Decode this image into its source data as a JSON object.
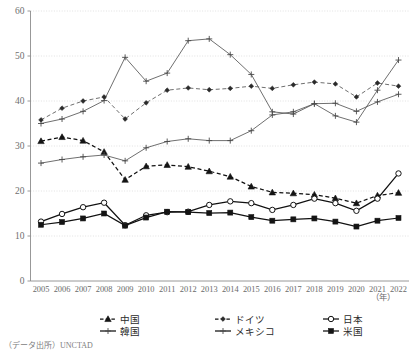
{
  "chart_data": {
    "type": "line",
    "title": "",
    "subtitle": "",
    "xlabel": "(年)",
    "ylabel": "",
    "ylim": [
      0,
      60
    ],
    "yticks": [
      0,
      10,
      20,
      30,
      40,
      50,
      60
    ],
    "grid": true,
    "legend_position": "bottom",
    "x": [
      2005,
      2006,
      2007,
      2008,
      2009,
      2010,
      2011,
      2012,
      2013,
      2014,
      2015,
      2016,
      2017,
      2018,
      2019,
      2020,
      2021,
      2022
    ],
    "categories": [
      "2005",
      "2006",
      "2007",
      "2008",
      "2009",
      "2010",
      "2011",
      "2012",
      "2013",
      "2014",
      "2015",
      "2016",
      "2017",
      "2018",
      "2019",
      "2020",
      "2021",
      "2022"
    ],
    "series": [
      {
        "name": "中国",
        "marker": "triangle-filled",
        "line": "dashed",
        "values": [
          31.1,
          32.0,
          31.2,
          28.7,
          22.5,
          25.5,
          25.8,
          25.4,
          24.4,
          23.2,
          21.0,
          19.7,
          19.5,
          19.2,
          18.4,
          17.3,
          19.0,
          19.6
        ]
      },
      {
        "name": "韓国",
        "marker": "cross",
        "line": "solid",
        "values": [
          35.0,
          36.0,
          37.7,
          40.1,
          49.7,
          44.4,
          46.2,
          53.4,
          53.8,
          50.3,
          45.9,
          37.6,
          37.1,
          39.4,
          36.7,
          35.3,
          42.4,
          49.1
        ]
      },
      {
        "name": "ドイツ",
        "marker": "diamond-filled",
        "line": "dashed",
        "values": [
          35.8,
          38.4,
          40.0,
          40.9,
          36.0,
          39.6,
          42.4,
          42.9,
          42.5,
          42.8,
          43.3,
          42.8,
          43.6,
          44.2,
          43.8,
          40.9,
          44.0,
          43.3
        ]
      },
      {
        "name": "メキシコ",
        "marker": "cross",
        "line": "solid",
        "values": [
          26.2,
          27.0,
          27.6,
          28.0,
          26.7,
          29.6,
          31.0,
          31.6,
          31.2,
          31.2,
          33.4,
          36.9,
          37.6,
          39.4,
          39.5,
          37.7,
          39.8,
          41.5
        ]
      },
      {
        "name": "日本",
        "marker": "circle-open",
        "line": "solid",
        "values": [
          13.2,
          14.9,
          16.4,
          17.4,
          12.4,
          14.6,
          15.3,
          15.4,
          16.9,
          17.7,
          17.3,
          15.8,
          16.9,
          18.3,
          17.3,
          15.6,
          18.3,
          23.9
        ]
      },
      {
        "name": "米国",
        "marker": "square-filled",
        "line": "solid",
        "values": [
          12.5,
          13.1,
          13.9,
          15.0,
          12.3,
          14.1,
          15.4,
          15.3,
          15.1,
          15.2,
          14.2,
          13.4,
          13.7,
          13.9,
          13.2,
          12.1,
          13.4,
          14.0
        ]
      }
    ]
  },
  "axis": {
    "y_tick_labels": [
      "60",
      "50",
      "40",
      "30",
      "20",
      "10",
      "0"
    ],
    "x_tick_labels": [
      "2005",
      "2006",
      "2007",
      "2008",
      "2009",
      "2010",
      "2011",
      "2012",
      "2013",
      "2014",
      "2015",
      "2016",
      "2017",
      "2018",
      "2019",
      "2020",
      "2021",
      "2022"
    ],
    "x_unit": "（年）"
  },
  "legend": {
    "items": [
      {
        "label": "中国",
        "marker": "triangle-filled",
        "line": "dashed"
      },
      {
        "label": "ドイツ",
        "marker": "diamond-filled",
        "line": "dashed"
      },
      {
        "label": "日本",
        "marker": "circle-open",
        "line": "solid"
      },
      {
        "label": "韓国",
        "marker": "cross",
        "line": "solid"
      },
      {
        "label": "メキシコ",
        "marker": "cross",
        "line": "solid"
      },
      {
        "label": "米国",
        "marker": "square-filled",
        "line": "solid"
      }
    ]
  },
  "footer": {
    "source": "（データ出所）UNCTAD"
  },
  "colors": {
    "axis": "#8c8c8c",
    "grid": "#d9d9d9",
    "line_dark": "#141414",
    "line_light": "#555555",
    "text": "#3a3a3a"
  }
}
